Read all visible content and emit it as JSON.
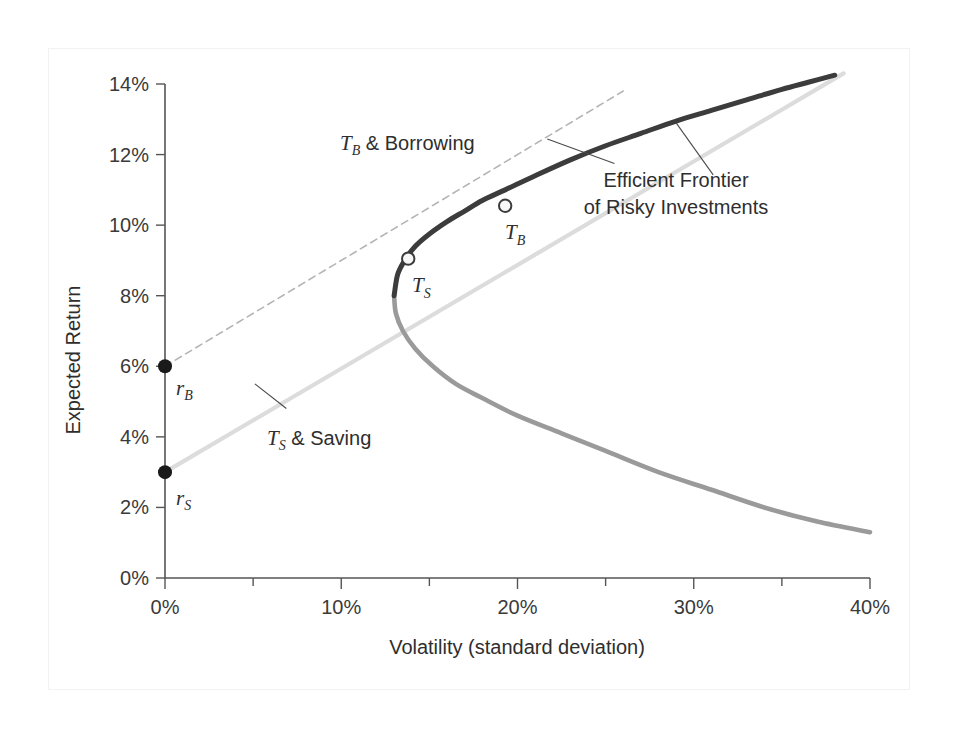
{
  "chart_data": {
    "type": "line",
    "title": "",
    "xlabel": "Volatility (standard deviation)",
    "ylabel": "Expected Return",
    "xlim": [
      0,
      40
    ],
    "ylim": [
      0,
      14
    ],
    "grid": false,
    "legend": "none",
    "x_ticks": [
      "0%",
      "10%",
      "20%",
      "30%",
      "40%"
    ],
    "x_tick_values": [
      0,
      10,
      20,
      30,
      40
    ],
    "x_minor_tick_values": [
      5,
      15,
      25,
      35
    ],
    "y_ticks": [
      "0%",
      "2%",
      "4%",
      "6%",
      "8%",
      "10%",
      "12%",
      "14%"
    ],
    "y_tick_values": [
      0,
      2,
      4,
      6,
      8,
      10,
      12,
      14
    ],
    "series": [
      {
        "name": "Efficient Frontier of Risky Investments",
        "style": "solid-dark",
        "color": "#3c3c3c",
        "points": [
          [
            13.0,
            8.0
          ],
          [
            13.2,
            8.6
          ],
          [
            13.6,
            9.0
          ],
          [
            14.2,
            9.4
          ],
          [
            15.0,
            9.75
          ],
          [
            16.0,
            10.1
          ],
          [
            17.0,
            10.4
          ],
          [
            18.0,
            10.7
          ],
          [
            19.3,
            11.0
          ],
          [
            21.0,
            11.4
          ],
          [
            23.0,
            11.85
          ],
          [
            25.0,
            12.25
          ],
          [
            27.0,
            12.6
          ],
          [
            29.0,
            12.95
          ],
          [
            31.0,
            13.25
          ],
          [
            33.0,
            13.55
          ],
          [
            35.0,
            13.85
          ],
          [
            36.5,
            14.05
          ],
          [
            38.0,
            14.25
          ]
        ]
      },
      {
        "name": "Inefficient lower branch of risky investment set",
        "style": "solid-light",
        "color": "#9a9a9a",
        "points": [
          [
            13.0,
            8.0
          ],
          [
            13.1,
            7.5
          ],
          [
            13.5,
            7.0
          ],
          [
            14.2,
            6.5
          ],
          [
            15.2,
            6.0
          ],
          [
            16.5,
            5.5
          ],
          [
            18.0,
            5.1
          ],
          [
            20.0,
            4.6
          ],
          [
            22.5,
            4.1
          ],
          [
            25.0,
            3.6
          ],
          [
            28.0,
            3.0
          ],
          [
            31.0,
            2.5
          ],
          [
            34.0,
            2.0
          ],
          [
            37.0,
            1.6
          ],
          [
            40.0,
            1.3
          ]
        ]
      },
      {
        "name": "T_B & Borrowing capital allocation line",
        "style": "dashed-light",
        "color": "#b4b4b4",
        "points": [
          [
            0.0,
            6.0
          ],
          [
            26.0,
            13.8
          ]
        ]
      },
      {
        "name": "T_S & Saving capital allocation line",
        "style": "solid-verylight",
        "color": "#dcdcdc",
        "points": [
          [
            0.0,
            3.0
          ],
          [
            38.5,
            14.3
          ]
        ]
      }
    ],
    "markers": [
      {
        "id": "rB",
        "label": "r",
        "sub": "B",
        "x": 0.0,
        "y": 6.0,
        "style": "filled-dot",
        "color": "#1a1a1a"
      },
      {
        "id": "rS",
        "label": "r",
        "sub": "S",
        "x": 0.0,
        "y": 3.0,
        "style": "filled-dot",
        "color": "#1a1a1a"
      },
      {
        "id": "TS",
        "label": "T",
        "sub": "S",
        "x": 13.8,
        "y": 9.05,
        "style": "open-circle",
        "color": "#3c3c3c"
      },
      {
        "id": "TB",
        "label": "T",
        "sub": "B",
        "x": 19.3,
        "y": 10.55,
        "style": "open-circle",
        "color": "#3c3c3c"
      }
    ],
    "annotations": [
      {
        "id": "borrowing",
        "text_main": "T",
        "text_sub": "B",
        "text_rest": " & Borrowing",
        "full_text": "TB & Borrowing",
        "x": 12.5,
        "y": 12.3,
        "leader_to": [
          25.5,
          11.75
        ]
      },
      {
        "id": "efficient-frontier",
        "line1": "Efficient Frontier",
        "line2": "of Risky Investments",
        "x": 31.5,
        "y": 10.8,
        "leader_to": [
          29.0,
          12.9
        ]
      },
      {
        "id": "saving",
        "text_main": "T",
        "text_sub": "S",
        "text_rest": " & Saving",
        "full_text": "TS & Saving",
        "x": 7.0,
        "y": 4.35,
        "leader_to": [
          5.1,
          5.5
        ]
      }
    ]
  },
  "axes": {
    "y_title": "Expected Return",
    "x_title": "Volatility (standard deviation)",
    "y_tick_labels": [
      "14%",
      "12%",
      "10%",
      "8%",
      "6%",
      "4%",
      "2%",
      "0%"
    ],
    "x_tick_labels": [
      "0%",
      "10%",
      "20%",
      "30%",
      "40%"
    ]
  },
  "annotation_text": {
    "borrowing_prefix": "T",
    "borrowing_sub": "B",
    "borrowing_suffix": " & Borrowing",
    "saving_prefix": "T",
    "saving_sub": "S",
    "saving_suffix": " & Saving",
    "frontier_line1": "Efficient Frontier",
    "frontier_line2": "of Risky Investments",
    "rb_label": "r",
    "rb_sub": "B",
    "rs_label": "r",
    "rs_sub": "S",
    "ts_label": "T",
    "ts_sub": "S",
    "tb_label": "T",
    "tb_sub": "B"
  },
  "colors": {
    "frontier_dark": "#3c3c3c",
    "frontier_light": "#9a9a9a",
    "borrow_line": "#b4b4b4",
    "save_line": "#dcdcdc",
    "axis": "#555555",
    "text": "#2e2e2e",
    "background": "#ffffff",
    "frame": "#f2f2f2"
  }
}
